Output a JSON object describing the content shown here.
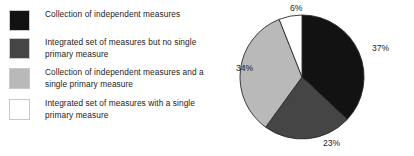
{
  "figure": {
    "background": "#ffffff",
    "text_color": "#232323"
  },
  "legend": {
    "items": [
      {
        "label": "Collection of independent measures",
        "color": "#121212",
        "swatch_name": "legend-swatch-black"
      },
      {
        "label": "Integrated set of measures but no single\nprimary measure",
        "color": "#454545",
        "swatch_name": "legend-swatch-dark-gray"
      },
      {
        "label": "Collection of independent measures and a\nsingle primary measure",
        "color": "#b9b9b9",
        "swatch_name": "legend-swatch-light-gray"
      },
      {
        "label": "Integrated set of measures with a single\nprimary measure",
        "color": "#ffffff",
        "swatch_name": "legend-swatch-white"
      }
    ]
  },
  "labels": {
    "top": "6%",
    "right": "37%",
    "bottom": "23%",
    "left": "34%"
  },
  "chart_data": {
    "type": "pie",
    "title": "",
    "legend_position": "left",
    "start_angle_deg": 0,
    "direction": "clockwise",
    "units": "percent",
    "categories": [
      "Collection of independent measures",
      "Integrated set of measures but no single primary measure",
      "Collection of independent measures and a single primary measure",
      "Integrated set of measures with a single primary measure"
    ],
    "values": [
      37,
      23,
      34,
      6
    ],
    "data_labels": [
      "37%",
      "23%",
      "34%",
      "6%"
    ],
    "colors": [
      "#121212",
      "#454545",
      "#b9b9b9",
      "#ffffff"
    ],
    "slice_edge_color": "#2b2b2b",
    "slices": [
      {
        "label": "Collection of independent measures",
        "value": 37,
        "data_label": "37%",
        "color": "#121212",
        "label_position": "right"
      },
      {
        "label": "Integrated set of measures but no single primary measure",
        "value": 23,
        "data_label": "23%",
        "color": "#454545",
        "label_position": "bottom"
      },
      {
        "label": "Collection of independent measures and a single primary measure",
        "value": 34,
        "data_label": "34%",
        "color": "#b9b9b9",
        "label_position": "left"
      },
      {
        "label": "Integrated set of measures with a single primary measure",
        "value": 6,
        "data_label": "6%",
        "color": "#ffffff",
        "label_position": "top"
      }
    ]
  }
}
